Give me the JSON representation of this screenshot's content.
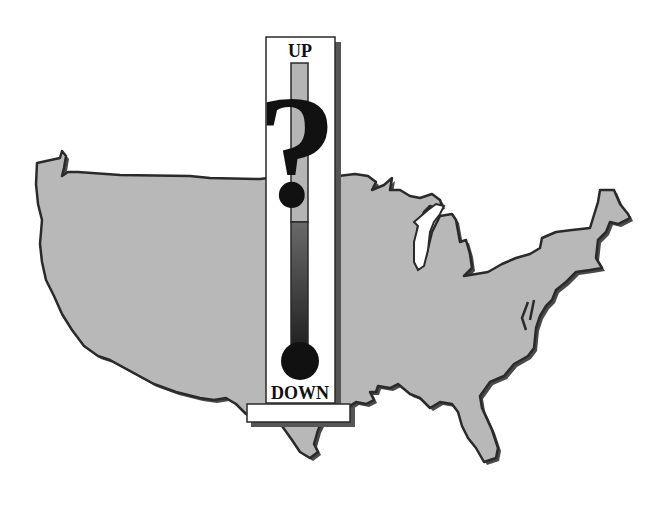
{
  "illustration": {
    "subject": "US map with thermometer",
    "map": {
      "fill": "#b8b8b8",
      "outline": "#2a2a2a",
      "shadow": "#555555",
      "lake_fill": "#ffffff"
    },
    "thermometer": {
      "top_label": "UP",
      "bottom_label": "DOWN",
      "symbol": "?",
      "frame_fill": "#ffffff",
      "frame_shadow": "#555555",
      "tube_upper_color": "#b5b5b5",
      "tube_lower_color": "#2e2e2e",
      "bulb_color": "#111111"
    }
  }
}
